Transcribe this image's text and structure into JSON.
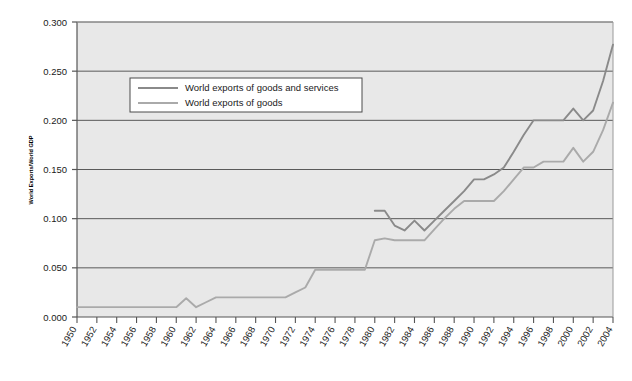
{
  "chart_data": {
    "type": "line",
    "title": "",
    "xlabel": "",
    "ylabel": "World Exports/World GDP",
    "xlim": [
      1950,
      2004
    ],
    "ylim": [
      0.0,
      0.3
    ],
    "grid": true,
    "grid_axis": "y",
    "legend_position": "upper-left-inside",
    "plot_background": "#e8e8e8",
    "ytick_labels": [
      "0.000",
      "0.050",
      "0.100",
      "0.150",
      "0.200",
      "0.250",
      "0.300"
    ],
    "ytick_values": [
      0.0,
      0.05,
      0.1,
      0.15,
      0.2,
      0.25,
      0.3
    ],
    "xtick_labels": [
      "1950",
      "1952",
      "1954",
      "1956",
      "1958",
      "1960",
      "1962",
      "1964",
      "1966",
      "1968",
      "1970",
      "1972",
      "1974",
      "1976",
      "1978",
      "1980",
      "1982",
      "1984",
      "1986",
      "1988",
      "1990",
      "1992",
      "1994",
      "1996",
      "1998",
      "2000",
      "2002",
      "2004"
    ],
    "xtick_values": [
      1950,
      1952,
      1954,
      1956,
      1958,
      1960,
      1962,
      1964,
      1966,
      1968,
      1970,
      1972,
      1974,
      1976,
      1978,
      1980,
      1982,
      1984,
      1986,
      1988,
      1990,
      1992,
      1994,
      1996,
      1998,
      2000,
      2002,
      2004
    ],
    "series": [
      {
        "name": "World exports of goods and services",
        "color": "#8a8a8a",
        "x": [
          1980,
          1981,
          1982,
          1983,
          1984,
          1985,
          1986,
          1987,
          1988,
          1989,
          1990,
          1991,
          1992,
          1993,
          1994,
          1995,
          1996,
          1997,
          1998,
          1999,
          2000,
          2001,
          2002,
          2003,
          2004
        ],
        "values": [
          0.108,
          0.108,
          0.093,
          0.088,
          0.098,
          0.088,
          0.098,
          0.108,
          0.118,
          0.128,
          0.14,
          0.14,
          0.145,
          0.152,
          0.168,
          0.185,
          0.2,
          0.2,
          0.2,
          0.2,
          0.212,
          0.2,
          0.21,
          0.24,
          0.277
        ]
      },
      {
        "name": "World exports of goods",
        "color": "#aaaaaa",
        "x": [
          1950,
          1951,
          1952,
          1953,
          1954,
          1955,
          1956,
          1957,
          1958,
          1959,
          1960,
          1961,
          1962,
          1963,
          1964,
          1965,
          1966,
          1967,
          1968,
          1969,
          1970,
          1971,
          1972,
          1973,
          1974,
          1975,
          1976,
          1977,
          1978,
          1979,
          1980,
          1981,
          1982,
          1983,
          1984,
          1985,
          1986,
          1987,
          1988,
          1989,
          1990,
          1991,
          1992,
          1993,
          1994,
          1995,
          1996,
          1997,
          1998,
          1999,
          2000,
          2001,
          2002,
          2003,
          2004
        ],
        "values": [
          0.01,
          0.01,
          0.01,
          0.01,
          0.01,
          0.01,
          0.01,
          0.01,
          0.01,
          0.01,
          0.01,
          0.019,
          0.01,
          0.015,
          0.02,
          0.02,
          0.02,
          0.02,
          0.02,
          0.02,
          0.02,
          0.02,
          0.025,
          0.03,
          0.048,
          0.048,
          0.048,
          0.048,
          0.048,
          0.048,
          0.078,
          0.08,
          0.078,
          0.078,
          0.078,
          0.078,
          0.089,
          0.1,
          0.11,
          0.118,
          0.118,
          0.118,
          0.118,
          0.128,
          0.14,
          0.152,
          0.152,
          0.158,
          0.158,
          0.158,
          0.172,
          0.158,
          0.168,
          0.19,
          0.218
        ]
      }
    ]
  },
  "legend": {
    "entries": [
      {
        "label": "World exports of goods and services"
      },
      {
        "label": "World exports of goods"
      }
    ]
  },
  "axes": {
    "y_title": "World Exports/World GDP"
  }
}
